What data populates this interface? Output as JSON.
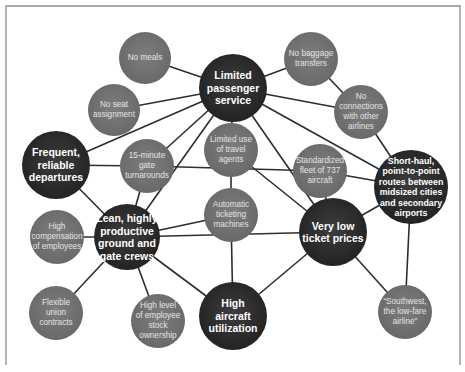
{
  "diagram": {
    "type": "activity-system-map",
    "colors": {
      "major_node": "#262626",
      "minor_node": "#6a6a6a",
      "edge": "#2e2e2e",
      "frame": "#a9a9a9",
      "background": "#ffffff"
    },
    "nodes": [
      {
        "id": "lps",
        "label": "Limited\npassenger\nservice",
        "kind": "major",
        "x": 233,
        "y": 88,
        "r": 34
      },
      {
        "id": "no_meals",
        "label": "No meals",
        "kind": "minor",
        "x": 145,
        "y": 58,
        "r": 26
      },
      {
        "id": "no_baggage",
        "label": "No baggage\ntransfers",
        "kind": "minor",
        "x": 311,
        "y": 59,
        "r": 27
      },
      {
        "id": "no_seat",
        "label": "No seat\nassignment",
        "kind": "minor",
        "x": 114,
        "y": 110,
        "r": 26
      },
      {
        "id": "no_connections",
        "label": "No\nconnections\nwith other\nairlines",
        "kind": "minor",
        "x": 361,
        "y": 112,
        "r": 27
      },
      {
        "id": "frequent",
        "label": "Frequent,\nreliable\ndepartures",
        "kind": "major",
        "x": 56,
        "y": 165,
        "r": 34
      },
      {
        "id": "gate15",
        "label": "15-minute\ngate\nturnarounds",
        "kind": "minor",
        "x": 147,
        "y": 166,
        "r": 27
      },
      {
        "id": "travel_agents",
        "label": "Limited use\nof travel\nagents",
        "kind": "minor",
        "x": 231,
        "y": 150,
        "r": 27
      },
      {
        "id": "fleet737",
        "label": "Standardized\nfleet of 737\naircraft",
        "kind": "minor",
        "x": 320,
        "y": 171,
        "r": 27
      },
      {
        "id": "short_haul",
        "label": "Short-haul,\npoint-to-point\nroutes between\nmidsized cities\nand secondary\nairports",
        "kind": "major-small",
        "x": 411,
        "y": 187,
        "r": 37
      },
      {
        "id": "high_comp",
        "label": "High\ncompensation\nof employees",
        "kind": "minor",
        "x": 57,
        "y": 237,
        "r": 27
      },
      {
        "id": "lean_crews",
        "label": "Lean, highly\nproductive\nground and\ngate crews",
        "kind": "major",
        "x": 127,
        "y": 237,
        "r": 33
      },
      {
        "id": "auto_ticket",
        "label": "Automatic\nticketing\nmachines",
        "kind": "minor",
        "x": 231,
        "y": 215,
        "r": 27
      },
      {
        "id": "low_prices",
        "label": "Very low\nticket prices",
        "kind": "major",
        "x": 333,
        "y": 232,
        "r": 34
      },
      {
        "id": "union",
        "label": "Flexible\nunion\ncontracts",
        "kind": "minor",
        "x": 56,
        "y": 313,
        "r": 27
      },
      {
        "id": "stock",
        "label": "High level\nof employee\nstock\nownership",
        "kind": "minor",
        "x": 158,
        "y": 321,
        "r": 27
      },
      {
        "id": "utilization",
        "label": "High\naircraft\nutilization",
        "kind": "major",
        "x": 233,
        "y": 316,
        "r": 34
      },
      {
        "id": "southwest",
        "label": "“Southwest,\nthe low-fare\nairline”",
        "kind": "minor",
        "x": 405,
        "y": 312,
        "r": 27
      }
    ],
    "edges": [
      [
        "lps",
        "no_meals"
      ],
      [
        "lps",
        "no_baggage"
      ],
      [
        "lps",
        "no_seat"
      ],
      [
        "lps",
        "no_connections"
      ],
      [
        "lps",
        "frequent"
      ],
      [
        "lps",
        "gate15"
      ],
      [
        "lps",
        "lean_crews"
      ],
      [
        "lps",
        "travel_agents"
      ],
      [
        "lps",
        "low_prices"
      ],
      [
        "lps",
        "short_haul"
      ],
      [
        "no_baggage",
        "no_connections"
      ],
      [
        "no_connections",
        "short_haul"
      ],
      [
        "frequent",
        "gate15"
      ],
      [
        "frequent",
        "lean_crews"
      ],
      [
        "gate15",
        "lean_crews"
      ],
      [
        "gate15",
        "fleet737"
      ],
      [
        "travel_agents",
        "auto_ticket"
      ],
      [
        "travel_agents",
        "low_prices"
      ],
      [
        "fleet737",
        "short_haul"
      ],
      [
        "fleet737",
        "low_prices"
      ],
      [
        "short_haul",
        "low_prices"
      ],
      [
        "short_haul",
        "southwest"
      ],
      [
        "lean_crews",
        "high_comp"
      ],
      [
        "lean_crews",
        "auto_ticket"
      ],
      [
        "lean_crews",
        "low_prices"
      ],
      [
        "lean_crews",
        "union"
      ],
      [
        "lean_crews",
        "stock"
      ],
      [
        "lean_crews",
        "utilization"
      ],
      [
        "auto_ticket",
        "utilization"
      ],
      [
        "low_prices",
        "utilization"
      ],
      [
        "low_prices",
        "southwest"
      ]
    ]
  }
}
